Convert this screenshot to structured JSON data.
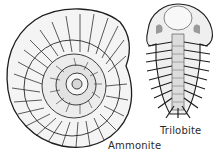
{
  "figures": [
    {
      "name": "ammonite",
      "label": "Ammonite"
    },
    {
      "name": "trilobite",
      "label": "Trilobite"
    }
  ],
  "colors": {
    "ink": "#1e1e1e",
    "paper": "#ffffff",
    "shade": "#8a8a8a"
  }
}
